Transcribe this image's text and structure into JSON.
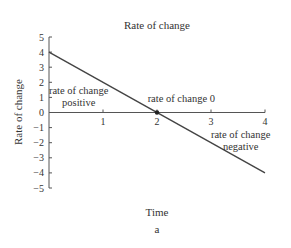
{
  "chart_data": {
    "type": "line",
    "title": "Rate of change",
    "xlabel": "Time",
    "ylabel": "Rate of change",
    "caption": "a",
    "xlim": [
      0,
      4
    ],
    "ylim": [
      -5,
      5
    ],
    "x_ticks": [
      1,
      2,
      3,
      4
    ],
    "y_ticks": [
      5,
      4,
      3,
      2,
      1,
      0,
      -1,
      -2,
      -3,
      -4,
      -5
    ],
    "grid": false,
    "series": [
      {
        "name": "rate of change",
        "x": [
          0,
          4
        ],
        "y": [
          4,
          -4
        ],
        "color": "#444444"
      }
    ],
    "markers": [
      {
        "x": 2,
        "y": 0,
        "label": "zero crossing"
      }
    ],
    "annotations": [
      {
        "text_lines": [
          "rate of change",
          "positive"
        ],
        "x": 0.55,
        "y": 1.2
      },
      {
        "text_lines": [
          "rate of change 0"
        ],
        "x": 2.45,
        "y": 0.7
      },
      {
        "text_lines": [
          "rate of change",
          "negative"
        ],
        "x": 3.55,
        "y": -1.7
      }
    ]
  }
}
